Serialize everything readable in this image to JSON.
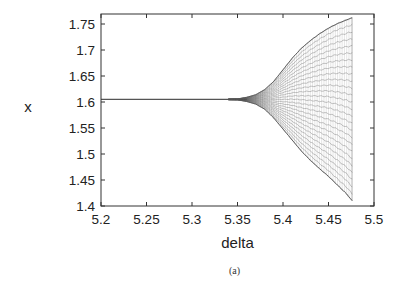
{
  "figure": {
    "caption": "(a)"
  },
  "chart_data": {
    "type": "scatter",
    "title": "",
    "xlabel": "delta",
    "ylabel": "x",
    "xlim": [
      5.2,
      5.5
    ],
    "ylim": [
      1.4,
      1.77
    ],
    "xticks": [
      5.2,
      5.25,
      5.3,
      5.35,
      5.4,
      5.45,
      5.5
    ],
    "xtick_labels": [
      "5.2",
      "5.25",
      "5.3",
      "5.35",
      "5.4",
      "5.45",
      "5.5"
    ],
    "yticks": [
      1.4,
      1.45,
      1.5,
      1.55,
      1.6,
      1.65,
      1.7,
      1.75
    ],
    "ytick_labels": [
      "1.4",
      "1.45",
      "1.5",
      "1.55",
      "1.6",
      "1.65",
      "1.7",
      "1.75"
    ],
    "grid": false,
    "legend": null,
    "series": [
      {
        "name": "upper envelope",
        "x": [
          5.2,
          5.3,
          5.35,
          5.36,
          5.37,
          5.38,
          5.39,
          5.4,
          5.41,
          5.42,
          5.43,
          5.44,
          5.45,
          5.46,
          5.47,
          5.476
        ],
        "y": [
          1.605,
          1.605,
          1.606,
          1.609,
          1.614,
          1.624,
          1.64,
          1.662,
          1.684,
          1.703,
          1.718,
          1.731,
          1.742,
          1.751,
          1.758,
          1.762
        ]
      },
      {
        "name": "lower envelope",
        "x": [
          5.2,
          5.3,
          5.35,
          5.36,
          5.37,
          5.38,
          5.39,
          5.4,
          5.41,
          5.42,
          5.43,
          5.44,
          5.45,
          5.46,
          5.47,
          5.476
        ],
        "y": [
          1.605,
          1.605,
          1.604,
          1.601,
          1.596,
          1.586,
          1.569,
          1.548,
          1.527,
          1.506,
          1.488,
          1.472,
          1.457,
          1.44,
          1.423,
          1.41
        ]
      }
    ],
    "colors": {
      "data": "#555555",
      "axes": "#333333",
      "text": "#222222"
    }
  }
}
